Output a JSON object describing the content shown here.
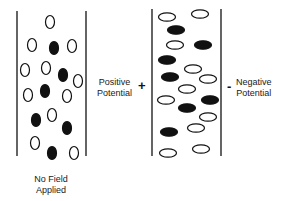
{
  "diagram": {
    "colors": {
      "stroke": "#111111",
      "filled": "#111111",
      "open": "#ffffff"
    },
    "panels": [
      {
        "id": "no-field",
        "label_lines": [
          "No Field",
          "Applied"
        ],
        "walls": {
          "left_x": 17,
          "right_x": 86,
          "top_y": 11,
          "bottom_y": 156
        },
        "particle_shape": {
          "rx": 4.5,
          "ry": 6.5
        },
        "particles": [
          {
            "x": 50,
            "y": 22,
            "filled": false
          },
          {
            "x": 32,
            "y": 45,
            "filled": false
          },
          {
            "x": 54,
            "y": 48,
            "filled": true
          },
          {
            "x": 72,
            "y": 46,
            "filled": false
          },
          {
            "x": 25,
            "y": 70,
            "filled": false
          },
          {
            "x": 46,
            "y": 68,
            "filled": false
          },
          {
            "x": 63,
            "y": 75,
            "filled": true
          },
          {
            "x": 78,
            "y": 81,
            "filled": false
          },
          {
            "x": 28,
            "y": 95,
            "filled": false
          },
          {
            "x": 45,
            "y": 91,
            "filled": true
          },
          {
            "x": 67,
            "y": 96,
            "filled": false
          },
          {
            "x": 36,
            "y": 120,
            "filled": true
          },
          {
            "x": 52,
            "y": 115,
            "filled": false
          },
          {
            "x": 67,
            "y": 128,
            "filled": true
          },
          {
            "x": 35,
            "y": 143,
            "filled": false
          },
          {
            "x": 52,
            "y": 153,
            "filled": true
          },
          {
            "x": 74,
            "y": 153,
            "filled": false
          }
        ]
      },
      {
        "id": "field-applied",
        "left_label_lines": [
          "Positive",
          "Potential"
        ],
        "left_sign": "+",
        "right_label_lines": [
          "Negative",
          "Potential"
        ],
        "right_sign": "-",
        "walls": {
          "left_x": 152,
          "right_x": 221,
          "top_y": 9,
          "bottom_y": 156
        },
        "particle_shape": {
          "rx": 8.5,
          "ry": 4.2
        },
        "particles": [
          {
            "x": 167,
            "y": 17,
            "filled": false
          },
          {
            "x": 200,
            "y": 14,
            "filled": false
          },
          {
            "x": 176,
            "y": 30,
            "filled": true
          },
          {
            "x": 175,
            "y": 45,
            "filled": false
          },
          {
            "x": 203,
            "y": 45,
            "filled": true
          },
          {
            "x": 167,
            "y": 60,
            "filled": true
          },
          {
            "x": 193,
            "y": 69,
            "filled": false
          },
          {
            "x": 170,
            "y": 77,
            "filled": true
          },
          {
            "x": 208,
            "y": 79,
            "filled": false
          },
          {
            "x": 187,
            "y": 89,
            "filled": false
          },
          {
            "x": 166,
            "y": 100,
            "filled": false
          },
          {
            "x": 210,
            "y": 100,
            "filled": true
          },
          {
            "x": 187,
            "y": 108,
            "filled": true
          },
          {
            "x": 208,
            "y": 117,
            "filled": false
          },
          {
            "x": 196,
            "y": 128,
            "filled": false
          },
          {
            "x": 169,
            "y": 132,
            "filled": true
          },
          {
            "x": 168,
            "y": 153,
            "filled": false
          },
          {
            "x": 201,
            "y": 149,
            "filled": false
          }
        ]
      }
    ]
  }
}
